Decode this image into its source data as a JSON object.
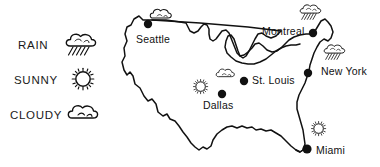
{
  "figure": {
    "kind": "weather-map",
    "region": "United States",
    "background_color": "#ffffff",
    "ink_color": "#111111",
    "width": 380,
    "height": 167
  },
  "legend": {
    "items": [
      {
        "label": "RAIN",
        "icon": "rain-cloud-icon",
        "x": 18,
        "y": 46
      },
      {
        "label": "SUNNY",
        "icon": "sun-icon",
        "x": 14,
        "y": 81
      },
      {
        "label": "CLOUDY",
        "icon": "cloud-icon",
        "x": 10,
        "y": 116
      }
    ]
  },
  "map": {
    "cities": [
      {
        "name": "Seattle",
        "condition": "cloudy",
        "icon": "cloud-icon",
        "label_x": 136,
        "label_y": 40,
        "marker_x": 148,
        "marker_y": 24,
        "icon_x": 158,
        "icon_y": 12
      },
      {
        "name": "Montreal",
        "condition": "rain",
        "icon": "rain-cloud-icon",
        "label_x": 262,
        "label_y": 31,
        "marker_x": 313,
        "marker_y": 33,
        "icon_x": 302,
        "icon_y": 5
      },
      {
        "name": "New York",
        "condition": "rain",
        "icon": "rain-cloud-icon",
        "label_x": 321,
        "label_y": 71,
        "marker_x": 308,
        "marker_y": 73,
        "icon_x": 326,
        "icon_y": 44
      },
      {
        "name": "St. Louis",
        "condition": "cloudy",
        "icon": "cloud-icon",
        "label_x": 254,
        "label_y": 80,
        "marker_x": 244,
        "marker_y": 81,
        "icon_x": 219,
        "icon_y": 68
      },
      {
        "name": "Dallas",
        "condition": "sunny",
        "icon": "sun-icon",
        "label_x": 204,
        "label_y": 106,
        "marker_x": 222,
        "marker_y": 94,
        "icon_x": 194,
        "icon_y": 80
      },
      {
        "name": "Miami",
        "condition": "sunny",
        "icon": "sun-icon",
        "label_x": 316,
        "label_y": 152,
        "marker_x": 307,
        "marker_y": 149,
        "icon_x": 312,
        "icon_y": 121
      }
    ]
  }
}
